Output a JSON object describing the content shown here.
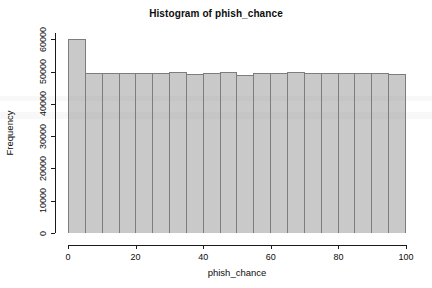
{
  "chart_data": {
    "type": "bar",
    "title": "Histogram of phish_chance",
    "xlabel": "phish_chance",
    "ylabel": "Frequency",
    "xlim": [
      0,
      100
    ],
    "ylim": [
      0,
      62000
    ],
    "grid": false,
    "legend": null,
    "bin_width": 5,
    "bin_edges": [
      0,
      5,
      10,
      15,
      20,
      25,
      30,
      35,
      40,
      45,
      50,
      55,
      60,
      65,
      70,
      75,
      80,
      85,
      90,
      95,
      100
    ],
    "categories": [
      "0-5",
      "5-10",
      "10-15",
      "15-20",
      "20-25",
      "25-30",
      "30-35",
      "35-40",
      "40-45",
      "45-50",
      "50-55",
      "55-60",
      "60-65",
      "65-70",
      "70-75",
      "75-80",
      "80-85",
      "85-90",
      "90-95",
      "95-100"
    ],
    "values": [
      60000,
      49700,
      49600,
      49500,
      49700,
      49600,
      50000,
      49200,
      49600,
      50000,
      49100,
      49700,
      49700,
      50000,
      49700,
      49600,
      49600,
      49500,
      49700,
      49400
    ],
    "x_ticks": [
      0,
      20,
      40,
      60,
      80,
      100
    ],
    "x_tick_labels": [
      "0",
      "20",
      "40",
      "60",
      "80",
      "100"
    ],
    "y_ticks": [
      0,
      10000,
      20000,
      30000,
      40000,
      50000,
      60000
    ],
    "y_tick_labels": [
      "0",
      "10000",
      "20000",
      "30000",
      "40000",
      "50000",
      "60000"
    ],
    "bar_fill_color": "#c9c9c9",
    "bar_border_color": "#7d7d7d",
    "axis_color": "#1a1a1a",
    "background_color": "#ffffff"
  }
}
